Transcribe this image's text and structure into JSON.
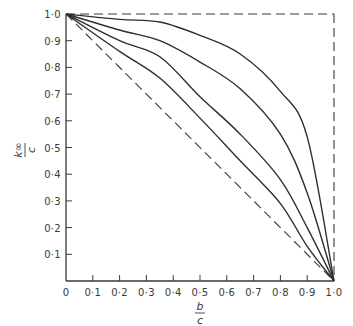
{
  "chart_data": {
    "type": "line",
    "title": "",
    "xlabel": "b/c",
    "ylabel": "k∞/c",
    "xlabel_parts": {
      "num": "b",
      "den": "c"
    },
    "ylabel_parts": {
      "num": "k∞",
      "den": "c"
    },
    "xlim": [
      0,
      1.0
    ],
    "ylim": [
      0,
      1.0
    ],
    "grid": false,
    "legend": null,
    "x_ticks": [
      "0",
      "0·1",
      "0·2",
      "0·3",
      "0·4",
      "0·5",
      "0·6",
      "0·7",
      "0·8",
      "0·9",
      "1·0"
    ],
    "y_ticks": [
      "0·1",
      "0·2",
      "0·3",
      "0·4",
      "0·5",
      "0·6",
      "0·7",
      "0·8",
      "0·9",
      "1·0"
    ],
    "x": [
      0,
      0.2,
      0.35,
      0.5,
      0.65,
      0.8,
      0.9,
      1.0
    ],
    "series": [
      {
        "name": "curve 1",
        "style": "solid",
        "values": [
          1.0,
          0.98,
          0.97,
          0.92,
          0.85,
          0.71,
          0.54,
          0.0
        ]
      },
      {
        "name": "curve 2",
        "style": "solid",
        "values": [
          1.0,
          0.94,
          0.9,
          0.82,
          0.72,
          0.55,
          0.33,
          0.0
        ]
      },
      {
        "name": "curve 3",
        "style": "solid",
        "values": [
          1.0,
          0.9,
          0.84,
          0.69,
          0.55,
          0.38,
          0.2,
          0.0
        ]
      },
      {
        "name": "curve 4",
        "style": "solid",
        "values": [
          1.0,
          0.86,
          0.76,
          0.61,
          0.45,
          0.29,
          0.13,
          0.0
        ]
      },
      {
        "name": "diagonal limit",
        "style": "dashed",
        "values": [
          1.0,
          0.8,
          0.65,
          0.5,
          0.35,
          0.2,
          0.1,
          0.0
        ]
      }
    ],
    "reference_lines": [
      {
        "name": "top limit",
        "style": "dashed",
        "from": [
          0,
          1.0
        ],
        "to": [
          1.0,
          1.0
        ]
      },
      {
        "name": "right limit",
        "style": "dashed",
        "from": [
          1.0,
          1.0
        ],
        "to": [
          1.0,
          0.0
        ]
      }
    ]
  }
}
